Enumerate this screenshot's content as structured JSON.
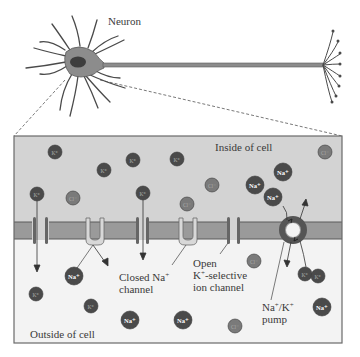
{
  "labels": {
    "neuron": "Neuron",
    "inside": "Inside of cell",
    "outside": "Outside of cell",
    "closed_na_line1_a": "Closed Na",
    "closed_na_line1_sup": "+",
    "closed_na_line2": "channel",
    "open_k_line1": "Open",
    "open_k_line2_a": "K",
    "open_k_line2_sup": "+",
    "open_k_line2_b": "-selective",
    "open_k_line3": "ion channel",
    "pump_line1_a": "Na",
    "pump_line1_sup1": "+",
    "pump_line1_mid": "/K",
    "pump_line1_sup2": "+",
    "pump_line2": "pump"
  },
  "colors": {
    "inside_fill": "#d3d3d3",
    "outside_fill": "#f3f3f3",
    "membrane_fill": "#9a9a9a",
    "membrane_edge": "#5a5a5a",
    "ion_dark": "#4a4a4a",
    "ion_mid": "#7a7a7a",
    "neuron_fill": "#8c8c8c"
  },
  "ions": [
    {
      "type": "K+",
      "label": "K⁺",
      "x": 55,
      "y": 152,
      "r": 7,
      "shade": "dark"
    },
    {
      "type": "K+",
      "label": "K⁺",
      "x": 104,
      "y": 170,
      "r": 7,
      "shade": "dark"
    },
    {
      "type": "K+",
      "label": "K⁺",
      "x": 133,
      "y": 160,
      "r": 7,
      "shade": "dark"
    },
    {
      "type": "K+",
      "label": "K⁺",
      "x": 177,
      "y": 159,
      "r": 7,
      "shade": "dark"
    },
    {
      "type": "K+",
      "label": "K⁺",
      "x": 37,
      "y": 194,
      "r": 7,
      "shade": "dark"
    },
    {
      "type": "Cl-",
      "label": "Cl⁻",
      "x": 73,
      "y": 198,
      "r": 7,
      "shade": "mid"
    },
    {
      "type": "K+",
      "label": "K⁺",
      "x": 143,
      "y": 193,
      "r": 7,
      "shade": "dark"
    },
    {
      "type": "Cl-",
      "label": "Cl⁻",
      "x": 212,
      "y": 185,
      "r": 7,
      "shade": "mid"
    },
    {
      "type": "Cl-",
      "label": "Cl⁻",
      "x": 187,
      "y": 204,
      "r": 7,
      "shade": "mid"
    },
    {
      "type": "Cl-",
      "label": "Cl⁻",
      "x": 325,
      "y": 152,
      "r": 7,
      "shade": "mid"
    },
    {
      "type": "Na+",
      "label": "Na⁺",
      "x": 283,
      "y": 172,
      "r": 9,
      "shade": "dark"
    },
    {
      "type": "Na+",
      "label": "Na⁺",
      "x": 255,
      "y": 185,
      "r": 9,
      "shade": "dark"
    },
    {
      "type": "Na+",
      "label": "Na⁺",
      "x": 273,
      "y": 197,
      "r": 9,
      "shade": "dark"
    },
    {
      "type": "Na+",
      "label": "Na⁺",
      "x": 74,
      "y": 276,
      "r": 9,
      "shade": "dark"
    },
    {
      "type": "K+",
      "label": "K⁺",
      "x": 36,
      "y": 294,
      "r": 7,
      "shade": "dark"
    },
    {
      "type": "K+",
      "label": "K⁺",
      "x": 91,
      "y": 306,
      "r": 7,
      "shade": "dark"
    },
    {
      "type": "Na+",
      "label": "Na⁺",
      "x": 130,
      "y": 320,
      "r": 9,
      "shade": "dark"
    },
    {
      "type": "Na+",
      "label": "Na⁺",
      "x": 183,
      "y": 320,
      "r": 9,
      "shade": "dark"
    },
    {
      "type": "Cl-",
      "label": "Cl⁻",
      "x": 235,
      "y": 326,
      "r": 7,
      "shade": "mid"
    },
    {
      "type": "Cl-",
      "label": "Cl⁻",
      "x": 254,
      "y": 261,
      "r": 7,
      "shade": "mid"
    },
    {
      "type": "K+",
      "label": "K⁺",
      "x": 305,
      "y": 274,
      "r": 7,
      "shade": "dark"
    },
    {
      "type": "K+",
      "label": "K⁺",
      "x": 318,
      "y": 276,
      "r": 7,
      "shade": "dark"
    },
    {
      "type": "Na+",
      "label": "Na⁺",
      "x": 322,
      "y": 307,
      "r": 9,
      "shade": "dark"
    }
  ]
}
